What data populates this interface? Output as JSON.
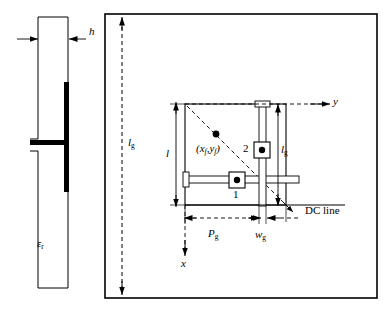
{
  "figure": {
    "type": "engineering-diagram",
    "background_color": "#ffffff",
    "line_color": "#000000",
    "metal_fill_color": "#000000"
  },
  "side_view": {
    "name": "side-view",
    "dimension_h": {
      "symbol": "h",
      "italic": true
    },
    "permittivity": {
      "symbol": "ε",
      "subscript": "r",
      "italic": true
    }
  },
  "top_view": {
    "name": "top-view",
    "ground_plane_label": {
      "symbol": "l",
      "subscript": "g"
    },
    "patch_length_label": {
      "symbol": "l"
    },
    "gap_length_label": {
      "symbol": "l",
      "subscript": "g"
    },
    "gap_position_label": {
      "symbol": "P",
      "subscript": "g"
    },
    "gap_width_label": {
      "symbol": "w",
      "subscript": "g"
    },
    "feed_point_label": {
      "text": "(x",
      "sub1": "f",
      "mid": ",y",
      "sub2": "f",
      "close": ")"
    },
    "port_1_label": "1",
    "port_2_label": "2",
    "dc_line_label": "DC line",
    "axis_y_label": "y",
    "axis_x_label": "x"
  }
}
